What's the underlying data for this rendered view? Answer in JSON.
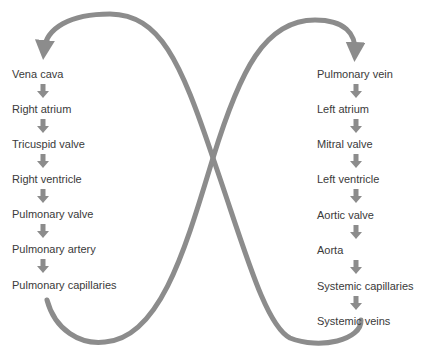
{
  "diagram": {
    "type": "circulation-flow",
    "line_color": "#8c8c8c",
    "text_color": "#3a3a3a",
    "left_column": [
      {
        "label": "Vena cava",
        "y": 68
      },
      {
        "label": "Right atrium",
        "y": 103
      },
      {
        "label": "Tricuspid valve",
        "y": 138
      },
      {
        "label": "Right ventricle",
        "y": 173
      },
      {
        "label": "Pulmonary valve",
        "y": 208
      },
      {
        "label": "Pulmonary artery",
        "y": 243
      },
      {
        "label": "Pulmonary capillaries",
        "y": 279
      }
    ],
    "right_column": [
      {
        "label": "Pulmonary vein",
        "y": 68
      },
      {
        "label": "Left atrium",
        "y": 103
      },
      {
        "label": "Mitral valve",
        "y": 138
      },
      {
        "label": "Left ventricle",
        "y": 173
      },
      {
        "label": "Aortic valve",
        "y": 209
      },
      {
        "label": "Aorta",
        "y": 244
      },
      {
        "label": "Systemic capillaries",
        "y": 280
      },
      {
        "label": "Systemic veins",
        "y": 315
      }
    ]
  }
}
